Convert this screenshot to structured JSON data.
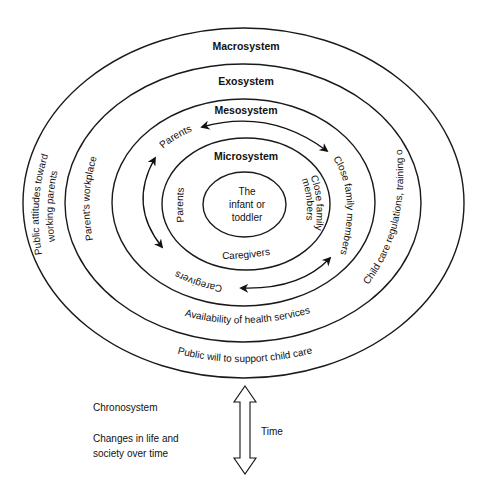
{
  "diagram": {
    "type": "nested-ellipses",
    "layers": [
      {
        "name": "Macrosystem",
        "labels": [
          "Public attitudes toward",
          "working parents",
          "Public will to support child care"
        ]
      },
      {
        "name": "Exosystem",
        "labels": [
          "Parent's workplace",
          "Child care regulations, training opportunities",
          "Availability of health services"
        ]
      },
      {
        "name": "Mesosystem",
        "labels": [
          "Parents",
          "Close family members",
          "Caregivers"
        ]
      },
      {
        "name": "Microsystem",
        "labels": [
          "Parents",
          "Close family",
          "members",
          "Caregivers"
        ]
      },
      {
        "name": "Center",
        "labels": [
          "The",
          "infant or",
          "toddler"
        ]
      }
    ],
    "chronosystem": {
      "title": "Chronosystem",
      "line1": "Changes in life and",
      "line2": "society over time",
      "arrow_label": "Time"
    }
  }
}
